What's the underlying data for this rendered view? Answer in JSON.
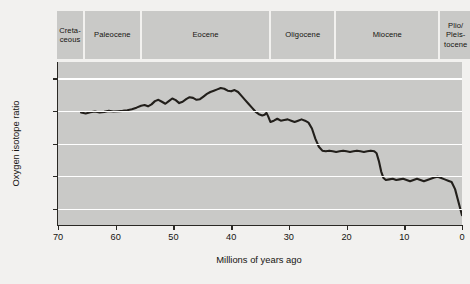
{
  "chart_data": {
    "type": "line",
    "title": "",
    "xlabel": "Millions of years ago",
    "ylabel": "Oxygen isotope ratio",
    "xlim": [
      70,
      0
    ],
    "ylim": [
      -1.5,
      3.5
    ],
    "y_inverted": true,
    "x_inverted": true,
    "grid": true,
    "legend": null,
    "xticks": [
      70,
      60,
      50,
      40,
      30,
      20,
      10,
      0
    ],
    "xtick_labels": [
      "70",
      "60",
      "50",
      "40",
      "30",
      "20",
      "10",
      "0"
    ],
    "yticks": [
      -1.0,
      0.0,
      1.0,
      2.0,
      3.0
    ],
    "ytick_labels": [
      "–1.0",
      "0.0",
      "1.0",
      "2.0",
      "3.0"
    ],
    "gridlines": [
      -1.0,
      0.0,
      1.0,
      2.0,
      3.0
    ],
    "series": [
      {
        "name": "Benthic oxygen isotope ratio",
        "color": "#221f1b",
        "x": [
          66.0,
          65.2,
          64.4,
          63.6,
          62.8,
          62.0,
          61.2,
          60.4,
          59.6,
          58.8,
          58.0,
          57.2,
          56.4,
          55.6,
          55.0,
          54.4,
          53.8,
          53.2,
          52.6,
          52.0,
          51.4,
          50.8,
          50.2,
          49.6,
          49.0,
          48.4,
          47.8,
          47.2,
          46.6,
          46.0,
          45.4,
          44.8,
          44.2,
          43.6,
          43.0,
          42.4,
          41.8,
          41.2,
          40.6,
          40.0,
          39.4,
          38.8,
          38.2,
          37.6,
          37.0,
          36.4,
          35.8,
          35.2,
          34.6,
          34.2,
          33.9,
          33.6,
          33.2,
          32.6,
          32.0,
          31.4,
          30.8,
          30.2,
          29.6,
          29.0,
          28.4,
          27.8,
          27.2,
          26.6,
          26.0,
          25.4,
          24.8,
          24.2,
          23.6,
          23.0,
          22.4,
          21.8,
          21.2,
          20.6,
          20.0,
          19.4,
          18.8,
          18.2,
          17.6,
          17.0,
          16.4,
          15.8,
          15.2,
          14.8,
          14.4,
          14.0,
          13.6,
          13.2,
          12.6,
          12.0,
          11.4,
          10.8,
          10.2,
          9.6,
          9.0,
          8.4,
          7.8,
          7.2,
          6.6,
          6.0,
          5.4,
          4.8,
          4.2,
          3.6,
          3.0,
          2.4,
          1.8,
          1.2,
          0.6,
          0.0
        ],
        "y": [
          0.05,
          0.08,
          0.04,
          0.02,
          0.05,
          0.03,
          0.0,
          0.02,
          0.01,
          0.0,
          -0.02,
          -0.05,
          -0.1,
          -0.16,
          -0.18,
          -0.14,
          -0.2,
          -0.3,
          -0.34,
          -0.28,
          -0.22,
          -0.3,
          -0.38,
          -0.33,
          -0.24,
          -0.28,
          -0.36,
          -0.42,
          -0.4,
          -0.34,
          -0.36,
          -0.44,
          -0.52,
          -0.58,
          -0.62,
          -0.66,
          -0.7,
          -0.68,
          -0.62,
          -0.6,
          -0.64,
          -0.58,
          -0.46,
          -0.34,
          -0.22,
          -0.1,
          0.02,
          0.1,
          0.14,
          0.12,
          0.06,
          0.16,
          0.34,
          0.3,
          0.24,
          0.3,
          0.28,
          0.26,
          0.3,
          0.34,
          0.3,
          0.26,
          0.3,
          0.36,
          0.54,
          0.86,
          1.1,
          1.22,
          1.24,
          1.22,
          1.24,
          1.26,
          1.24,
          1.22,
          1.24,
          1.26,
          1.24,
          1.22,
          1.24,
          1.26,
          1.24,
          1.22,
          1.24,
          1.3,
          1.54,
          1.86,
          2.06,
          2.12,
          2.1,
          2.08,
          2.12,
          2.1,
          2.08,
          2.12,
          2.16,
          2.12,
          2.08,
          2.12,
          2.16,
          2.12,
          2.08,
          2.04,
          2.02,
          2.06,
          2.1,
          2.14,
          2.18,
          2.4,
          2.8,
          3.2
        ]
      }
    ],
    "epochs": [
      {
        "label": "Creta-\nceous",
        "start": 70,
        "end": 65.5
      },
      {
        "label": "Paleocene",
        "start": 65.5,
        "end": 56.0
      },
      {
        "label": "Eocene",
        "start": 56.0,
        "end": 33.9
      },
      {
        "label": "Oligocene",
        "start": 33.9,
        "end": 23.0
      },
      {
        "label": "Miocene",
        "start": 23.0,
        "end": 5.3
      },
      {
        "label": "Plio/\nPleis-\ntocene",
        "start": 5.3,
        "end": 0
      }
    ]
  },
  "colors": {
    "page_background": "#f2f1ef",
    "plot_background": "#c9c9c7",
    "band_background": "#c9c9c7",
    "gridline": "#ffffff",
    "axis": "#2a2824",
    "curve": "#221f1b",
    "text": "#15130f"
  }
}
